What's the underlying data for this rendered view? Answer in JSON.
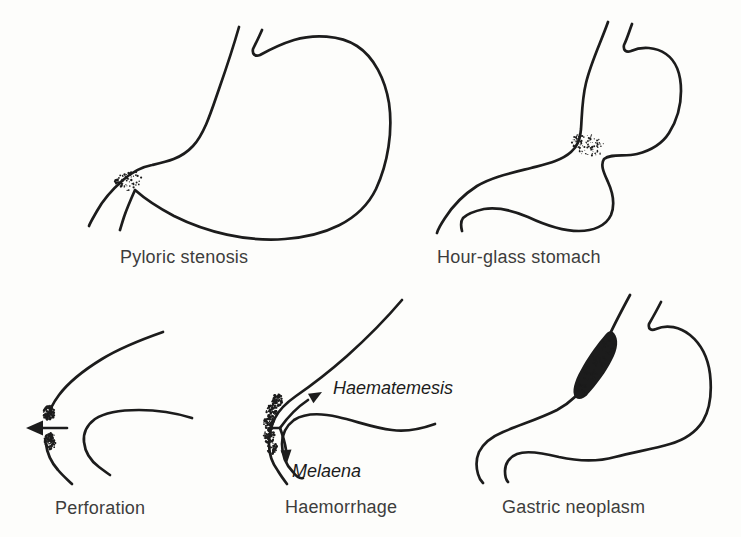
{
  "diagram": {
    "colors": {
      "ink": "#1c1c1c",
      "label": "#3d3d3d",
      "paper": "#fdfdfb"
    },
    "figures": [
      {
        "id": "pyloric-stenosis",
        "label": "Pyloric stenosis"
      },
      {
        "id": "hour-glass-stomach",
        "label": "Hour-glass stomach"
      },
      {
        "id": "perforation",
        "label": "Perforation"
      },
      {
        "id": "haemorrhage",
        "label": "Haemorrhage",
        "annotations": [
          {
            "text": "Haematemesis"
          },
          {
            "text": "Melaena"
          }
        ]
      },
      {
        "id": "gastric-neoplasm",
        "label": "Gastric neoplasm"
      }
    ]
  }
}
